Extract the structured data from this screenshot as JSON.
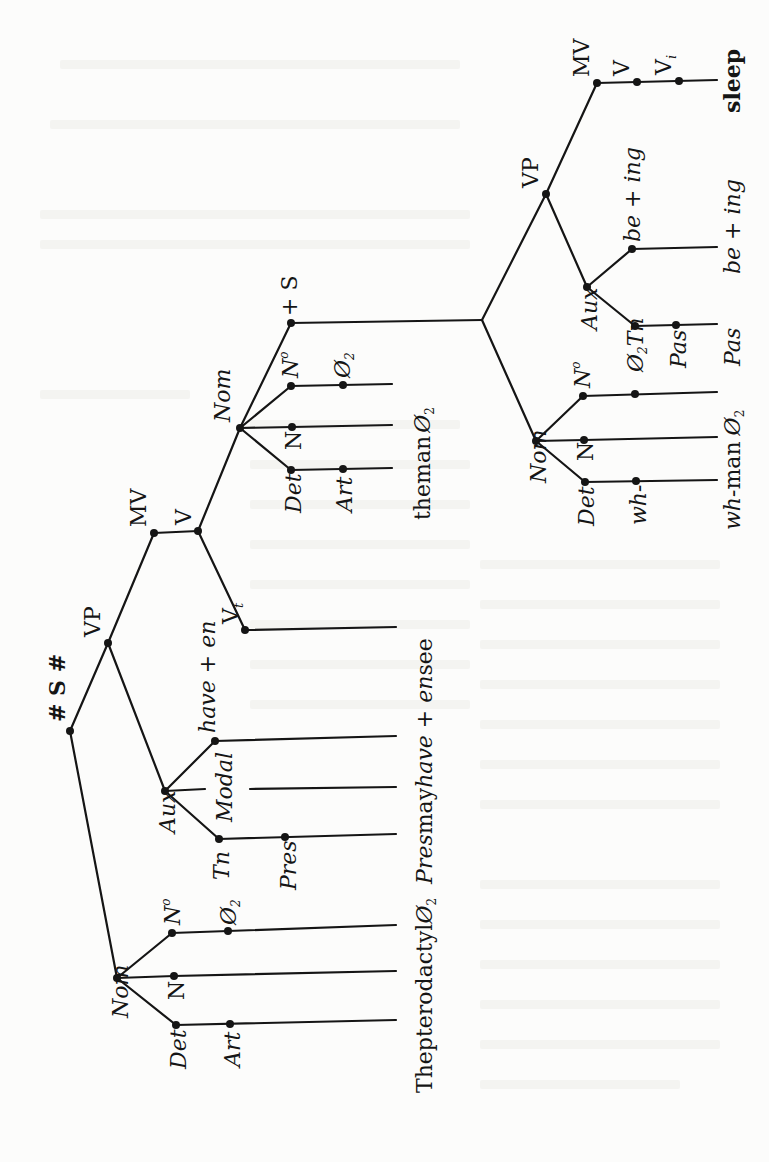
{
  "diagram": {
    "type": "phrase-structure-tree",
    "orientation": "rotated-90-ccw",
    "root": "# S #",
    "colors": {
      "ink": "#151515",
      "paper": "#fcfcfb",
      "bleed": "#ececea"
    },
    "main_clause": {
      "S": "# S #",
      "Nom": {
        "label": "Nom",
        "children": [
          {
            "label": "Det",
            "sub": "Art",
            "terminal": "The"
          },
          {
            "label": "N",
            "terminal": "pterodactyl"
          },
          {
            "label": "N²",
            "sub": "Ø₂",
            "terminal": "Ø₂"
          }
        ]
      },
      "VP": {
        "label": "VP",
        "Aux": {
          "label": "Aux",
          "children": [
            {
              "label": "Tn",
              "sub": "Pres",
              "terminal": "Pres"
            },
            {
              "label": "Modal",
              "terminal": "may"
            },
            {
              "label": "have + en",
              "terminal": "have + en"
            }
          ]
        },
        "MV": {
          "label": "MV",
          "V": "V",
          "V_t": "Vₜ",
          "terminal": "see",
          "object_Nom": {
            "label": "Nom",
            "children": [
              {
                "label": "Det",
                "sub": "Art",
                "terminal": "the"
              },
              {
                "label": "N",
                "terminal": "man"
              },
              {
                "label": "N²",
                "sub": "Ø₂",
                "terminal": "Ø₂"
              }
            ],
            "plus_S": "+ S"
          }
        }
      }
    },
    "embedded_clause": {
      "Nom": {
        "label": "Nom",
        "children": [
          {
            "label": "Det",
            "sub": "wh-",
            "terminal": "wh-"
          },
          {
            "label": "N",
            "terminal": "man"
          },
          {
            "label": "N²",
            "sub": "Ø₂",
            "terminal": "Ø₂"
          }
        ]
      },
      "VP": {
        "label": "VP",
        "Aux": {
          "label": "Aux",
          "children": [
            {
              "label": "Tn",
              "sub": "Pas",
              "terminal": "Pas"
            },
            {
              "label": "be + ing",
              "terminal": "be + ing"
            }
          ]
        },
        "MV": {
          "label": "MV",
          "V": "V",
          "V_i": "Vᵢ",
          "terminal": "sleep"
        }
      }
    },
    "terminal_strings": {
      "main": "The pterodactyl Ø₂ Pres may have + en see",
      "object": "the man Ø₂",
      "embedded": "wh-man Ø₂ Pas be + ing sleep"
    }
  },
  "labels": {
    "root": "# S #",
    "vp_main": "VP",
    "mv_main": "MV",
    "v_main": "V",
    "vt_main": "V",
    "vt_sub": "t",
    "nom_main": "Nom",
    "det_main": "Det",
    "n_main": "N",
    "n2_main": "N",
    "n2_sup": "o",
    "art_main": "Art",
    "null_main": "Ø",
    "null_sub": "2",
    "aux_main": "Aux",
    "tn_main": "Tn",
    "pres_main": "Pres",
    "modal_main": "Modal",
    "have_en": "have + en",
    "nom_obj": "Nom",
    "det_obj": "Det",
    "n_obj": "N",
    "n2_obj": "N",
    "art_obj": "Art",
    "null_obj": "Ø",
    "plus_s": "+ S",
    "nom_rel": "Nom",
    "det_rel": "Det",
    "n_rel": "N",
    "n2_rel": "N",
    "wh_rel": "wh-",
    "null_rel": "Ø",
    "tn_rel": "Tn",
    "aux_rel": "Aux",
    "pas_rel": "Pas",
    "be_ing_rel": "be + ing",
    "vp_rel": "VP",
    "mv_rel": "MV",
    "v_rel": "V",
    "vi_rel": "V",
    "vi_sub": "i",
    "term_main_1": "The",
    "term_main_2": "pterodactyl",
    "term_main_3": "Ø",
    "term_main_4": "Pres",
    "term_main_5": "may",
    "term_main_6": "have",
    "term_main_7": " + ",
    "term_main_8": "en",
    "term_main_9": "see",
    "term_obj_1": "the",
    "term_obj_2": "man",
    "term_obj_3": "Ø",
    "term_rel_1": "wh-",
    "term_rel_2": "man",
    "term_rel_3": "Ø",
    "term_rel_4": "Pas",
    "term_rel_5": "be + ing",
    "term_rel_6": "sleep"
  }
}
